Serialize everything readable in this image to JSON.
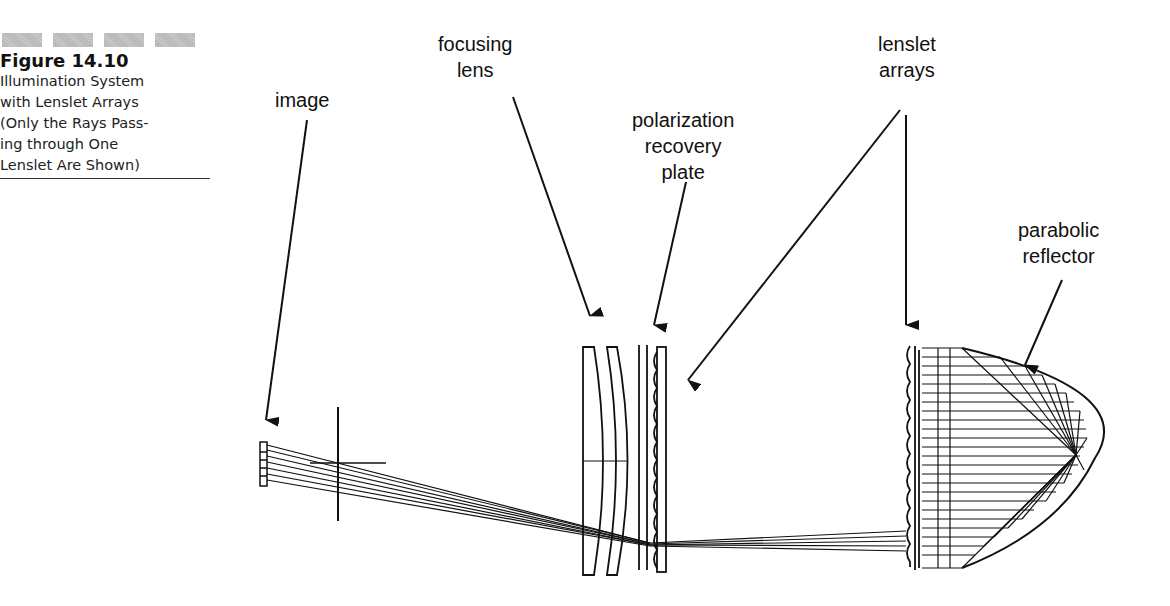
{
  "caption": {
    "figure_number": "Figure 14.10",
    "lines": [
      "Illumination System",
      "with Lenslet Arrays",
      "(Only the Rays Pass-",
      "ing through One",
      "Lenslet Are Shown)"
    ]
  },
  "labels": {
    "image": "image",
    "focusing_lens": "focusing\nlens",
    "polarization_plate": "polarization\nrecovery\nplate",
    "lenslet_arrays": "lenslet\narrays",
    "parabolic_reflector": "parabolic\nreflector"
  }
}
